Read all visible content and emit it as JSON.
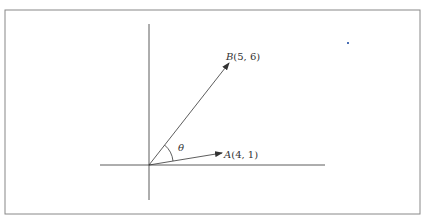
{
  "diagram": {
    "type": "vector-angle",
    "axes": {
      "horizontal": true,
      "vertical": true
    },
    "vectors": [
      {
        "name": "A",
        "label": "A(4, 1)",
        "point": [
          4,
          1
        ]
      },
      {
        "name": "B",
        "label": "B(5, 6)",
        "point": [
          5,
          6
        ]
      }
    ],
    "angle_label": "θ",
    "colors": {
      "line": "#333333",
      "border": "#888888",
      "dot": "#4a6fb5"
    }
  },
  "labels": {
    "b_name": "B",
    "b_coords": "(5, 6)",
    "a_name": "A",
    "a_coords": "(4, 1)",
    "theta": "θ"
  }
}
